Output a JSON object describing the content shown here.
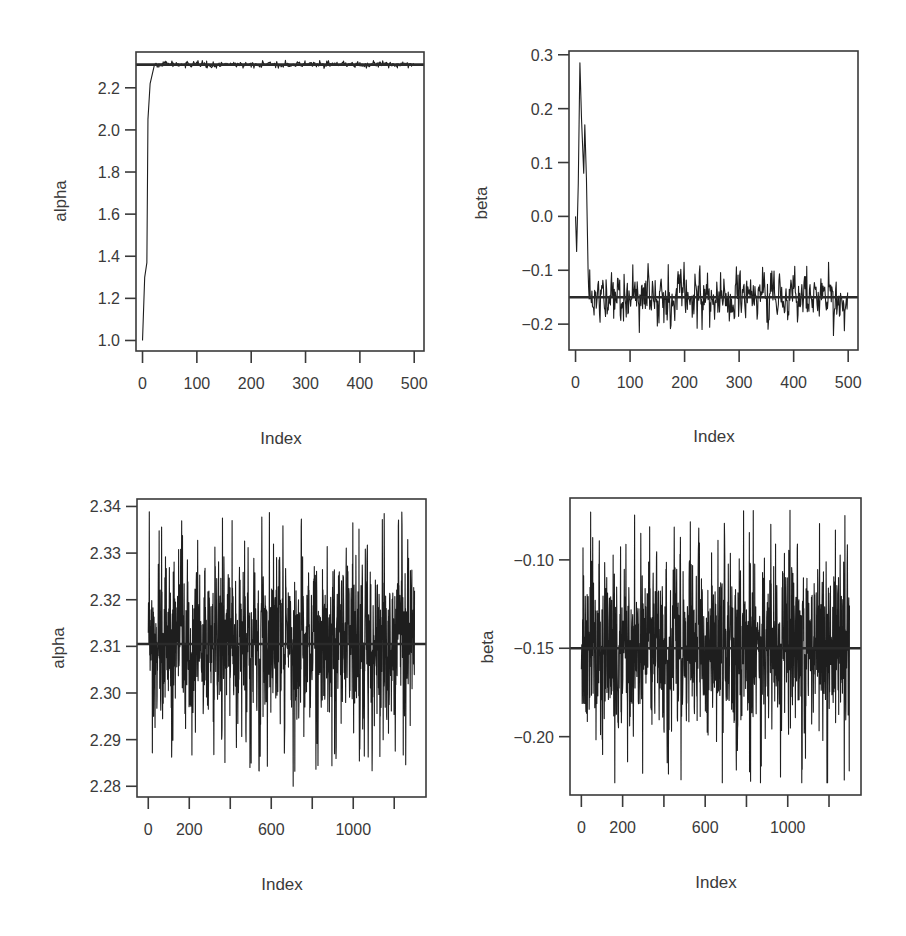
{
  "chart_data": [
    {
      "id": "top-left",
      "type": "line",
      "title": "",
      "xlabel": "Index",
      "ylabel": "alpha",
      "xlim": [
        -12,
        518
      ],
      "ylim": [
        0.95,
        2.37
      ],
      "xticks": [
        0,
        100,
        200,
        300,
        400,
        500
      ],
      "xtick_labels": [
        "0",
        "100",
        "200",
        "300",
        "400",
        "500"
      ],
      "yticks": [
        1.0,
        1.2,
        1.4,
        1.6,
        1.8,
        2.0,
        2.2
      ],
      "ytick_labels": [
        "1.0",
        "1.2",
        "1.4",
        "1.6",
        "1.8",
        "2.0",
        "2.2"
      ],
      "reference_line": 2.31,
      "n_iterations": 500,
      "burn_in_path": [
        [
          0,
          1.0
        ],
        [
          4,
          1.3
        ],
        [
          8,
          1.37
        ],
        [
          10,
          2.05
        ],
        [
          14,
          2.22
        ],
        [
          22,
          2.31
        ]
      ],
      "stationary": {
        "mean": 2.311,
        "sd": 0.006,
        "min": 2.29,
        "max": 2.33
      },
      "grid": false,
      "legend": null
    },
    {
      "id": "top-right",
      "type": "line",
      "title": "",
      "xlabel": "Index",
      "ylabel": "beta",
      "xlim": [
        -12,
        518
      ],
      "ylim": [
        -0.248,
        0.307
      ],
      "xticks": [
        0,
        100,
        200,
        300,
        400,
        500
      ],
      "xtick_labels": [
        "0",
        "100",
        "200",
        "300",
        "400",
        "500"
      ],
      "yticks": [
        -0.2,
        -0.1,
        0.0,
        0.1,
        0.2,
        0.3
      ],
      "ytick_labels": [
        "−0.2",
        "−0.1",
        "0.0",
        "0.1",
        "0.2",
        "0.3"
      ],
      "reference_line": -0.15,
      "n_iterations": 500,
      "burn_in_path": [
        [
          0,
          0.0
        ],
        [
          2,
          -0.065
        ],
        [
          5,
          0.06
        ],
        [
          8,
          0.285
        ],
        [
          11,
          0.18
        ],
        [
          15,
          0.08
        ],
        [
          17,
          0.17
        ],
        [
          20,
          0.07
        ],
        [
          23,
          -0.1
        ]
      ],
      "stationary": {
        "mean": -0.15,
        "sd": 0.022,
        "min": -0.225,
        "max": -0.085
      },
      "grid": false,
      "legend": null
    },
    {
      "id": "bottom-left",
      "type": "line",
      "title": "",
      "xlabel": "Index",
      "ylabel": "alpha",
      "xlim": [
        -55,
        1355
      ],
      "ylim": [
        2.2777,
        2.3416
      ],
      "xticks": [
        0,
        200,
        400,
        600,
        800,
        1000,
        1200
      ],
      "xtick_labels": [
        "0",
        "200",
        "",
        "600",
        "",
        "1000",
        ""
      ],
      "yticks": [
        2.28,
        2.29,
        2.3,
        2.31,
        2.32,
        2.33,
        2.34
      ],
      "ytick_labels": [
        "2.28",
        "2.29",
        "2.30",
        "2.31",
        "2.32",
        "2.33",
        "2.34"
      ],
      "reference_line": 2.3105,
      "n_iterations": 1300,
      "stationary": {
        "mean": 2.311,
        "sd": 0.0085,
        "min": 2.28,
        "max": 2.339
      },
      "grid": false,
      "legend": null
    },
    {
      "id": "bottom-right",
      "type": "line",
      "title": "",
      "xlabel": "Index",
      "ylabel": "beta",
      "xlim": [
        -55,
        1355
      ],
      "ylim": [
        -0.233,
        -0.065
      ],
      "xticks": [
        0,
        200,
        400,
        600,
        800,
        1000,
        1200
      ],
      "xtick_labels": [
        "0",
        "200",
        "",
        "600",
        "",
        "1000",
        ""
      ],
      "yticks": [
        -0.2,
        -0.15,
        -0.1
      ],
      "ytick_labels": [
        "−0.20",
        "−0.15",
        "−0.10"
      ],
      "reference_line": -0.15,
      "n_iterations": 1300,
      "stationary": {
        "mean": -0.15,
        "sd": 0.024,
        "min": -0.226,
        "max": -0.072
      },
      "grid": false,
      "legend": null
    }
  ],
  "panels": [
    {
      "ylabel": "alpha",
      "xlabel": "Index"
    },
    {
      "ylabel": "beta",
      "xlabel": "Index"
    },
    {
      "ylabel": "alpha",
      "xlabel": "Index"
    },
    {
      "ylabel": "beta",
      "xlabel": "Index"
    }
  ],
  "colors": {
    "trace": "#1e1e1e",
    "axis": "#3a3a3a",
    "background": "#ffffff"
  }
}
